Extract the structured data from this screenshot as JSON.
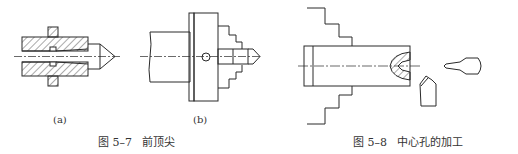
{
  "figure_5_7": {
    "sub_a_label": "(a)",
    "sub_b_label": "(b)",
    "caption": "图 5–7   前顶尖"
  },
  "figure_5_8": {
    "caption": "图 5–8   中心孔的加工"
  },
  "colors": {
    "line": "#2a2a2a",
    "hatch": "#555555",
    "background": "#ffffff"
  }
}
